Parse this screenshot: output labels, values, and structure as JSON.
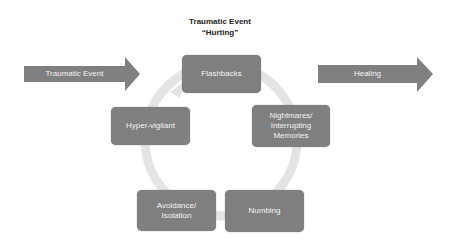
{
  "title": {
    "line1": "Traumatic Event",
    "line2": "“Hurting”"
  },
  "arrows": {
    "input": {
      "label": "Traumatic Event"
    },
    "output": {
      "label": "Healing"
    }
  },
  "cycle": {
    "nodes": [
      {
        "label": "Flashbacks"
      },
      {
        "label": "Nightmares/ Interrupting Memories"
      },
      {
        "label": "Numbing"
      },
      {
        "label": "Avoidance/ Isolation"
      },
      {
        "label": "Hyper-vigilant"
      }
    ]
  },
  "colors": {
    "box": "#7f7f7f",
    "arrow": "#808080",
    "cycle_ring": "#e4e4e4",
    "text": "#f4f4f4"
  }
}
